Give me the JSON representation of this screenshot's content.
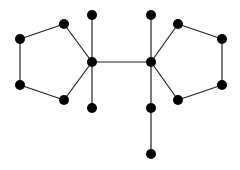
{
  "diagram": {
    "type": "graph",
    "colors": {
      "node": "#000000",
      "edge": "#222222",
      "background": "#ffffff"
    },
    "node_radius": 5,
    "nodes": [
      {
        "id": "L1",
        "x": 20,
        "y": 39
      },
      {
        "id": "L2",
        "x": 64,
        "y": 24
      },
      {
        "id": "L3",
        "x": 92,
        "y": 62
      },
      {
        "id": "L4",
        "x": 64,
        "y": 100
      },
      {
        "id": "L5",
        "x": 20,
        "y": 85
      },
      {
        "id": "LT",
        "x": 92,
        "y": 15
      },
      {
        "id": "LB",
        "x": 92,
        "y": 108
      },
      {
        "id": "R3",
        "x": 151,
        "y": 62
      },
      {
        "id": "R2",
        "x": 178,
        "y": 24
      },
      {
        "id": "R1",
        "x": 222,
        "y": 39
      },
      {
        "id": "R5",
        "x": 222,
        "y": 85
      },
      {
        "id": "R4",
        "x": 178,
        "y": 100
      },
      {
        "id": "RT",
        "x": 151,
        "y": 15
      },
      {
        "id": "RB",
        "x": 151,
        "y": 108
      },
      {
        "id": "RB2",
        "x": 151,
        "y": 154
      }
    ],
    "edges": [
      [
        "L1",
        "L2"
      ],
      [
        "L2",
        "L3"
      ],
      [
        "L3",
        "L4"
      ],
      [
        "L4",
        "L5"
      ],
      [
        "L5",
        "L1"
      ],
      [
        "LT",
        "L3"
      ],
      [
        "L3",
        "LB"
      ],
      [
        "L3",
        "R3"
      ],
      [
        "R3",
        "R2"
      ],
      [
        "R2",
        "R1"
      ],
      [
        "R1",
        "R5"
      ],
      [
        "R5",
        "R4"
      ],
      [
        "R4",
        "R3"
      ],
      [
        "RT",
        "R3"
      ],
      [
        "R3",
        "RB"
      ],
      [
        "RB",
        "RB2"
      ]
    ]
  }
}
